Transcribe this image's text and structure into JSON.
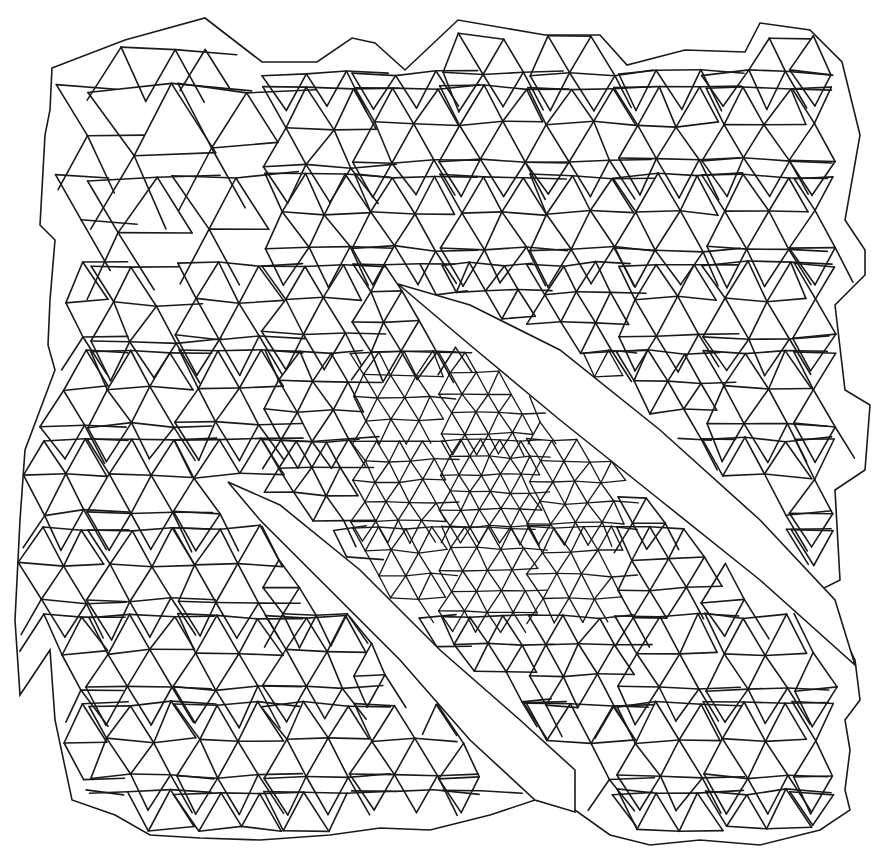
{
  "figure": {
    "width": 883,
    "height": 857,
    "stroke_color": "#1a1a1a",
    "background": "#ffffff"
  },
  "outline": [
    [
      52,
      68
    ],
    [
      125,
      40
    ],
    [
      205,
      18
    ],
    [
      262,
      62
    ],
    [
      317,
      62
    ],
    [
      352,
      38
    ],
    [
      375,
      43
    ],
    [
      405,
      70
    ],
    [
      458,
      20
    ],
    [
      545,
      35
    ],
    [
      600,
      35
    ],
    [
      627,
      65
    ],
    [
      685,
      50
    ],
    [
      745,
      52
    ],
    [
      760,
      23
    ],
    [
      810,
      30
    ],
    [
      842,
      62
    ],
    [
      860,
      135
    ],
    [
      845,
      220
    ],
    [
      865,
      250
    ],
    [
      865,
      275
    ],
    [
      835,
      305
    ],
    [
      845,
      390
    ],
    [
      870,
      405
    ],
    [
      865,
      470
    ],
    [
      835,
      490
    ],
    [
      840,
      580
    ],
    [
      820,
      590
    ],
    [
      855,
      660
    ],
    [
      860,
      700
    ],
    [
      845,
      720
    ],
    [
      850,
      750
    ],
    [
      845,
      790
    ],
    [
      850,
      810
    ],
    [
      820,
      830
    ],
    [
      760,
      845
    ],
    [
      700,
      840
    ],
    [
      650,
      845
    ],
    [
      610,
      835
    ],
    [
      575,
      810
    ],
    [
      535,
      800
    ],
    [
      490,
      815
    ],
    [
      430,
      830
    ],
    [
      380,
      828
    ],
    [
      330,
      835
    ],
    [
      260,
      840
    ],
    [
      200,
      838
    ],
    [
      150,
      835
    ],
    [
      115,
      815
    ],
    [
      72,
      800
    ],
    [
      55,
      720
    ],
    [
      50,
      650
    ],
    [
      20,
      695
    ],
    [
      15,
      620
    ],
    [
      20,
      520
    ],
    [
      25,
      450
    ],
    [
      55,
      370
    ],
    [
      48,
      345
    ],
    [
      50,
      300
    ],
    [
      55,
      240
    ],
    [
      40,
      225
    ],
    [
      45,
      135
    ],
    [
      50,
      110
    ]
  ],
  "slits": [
    {
      "name": "upper-slit",
      "polygon": [
        [
          398,
          284
        ],
        [
          470,
          305
        ],
        [
          560,
          350
        ],
        [
          660,
          430
        ],
        [
          760,
          520
        ],
        [
          835,
          600
        ],
        [
          855,
          665
        ],
        [
          760,
          580
        ],
        [
          660,
          500
        ],
        [
          560,
          420
        ],
        [
          470,
          345
        ]
      ]
    },
    {
      "name": "lower-slit",
      "polygon": [
        [
          228,
          482
        ],
        [
          280,
          505
        ],
        [
          360,
          570
        ],
        [
          440,
          650
        ],
        [
          520,
          720
        ],
        [
          575,
          770
        ],
        [
          575,
          812
        ],
        [
          535,
          800
        ],
        [
          470,
          740
        ],
        [
          400,
          660
        ],
        [
          320,
          580
        ],
        [
          260,
          520
        ]
      ]
    }
  ],
  "density_regions": [
    {
      "name": "coarse-top-left",
      "spacing": 88,
      "center": [
        150,
        150
      ],
      "radius": 170
    },
    {
      "name": "fine-core",
      "spacing": 20,
      "center": [
        480,
        480
      ],
      "radius": 260
    },
    {
      "name": "medium-default",
      "spacing": 42
    }
  ]
}
